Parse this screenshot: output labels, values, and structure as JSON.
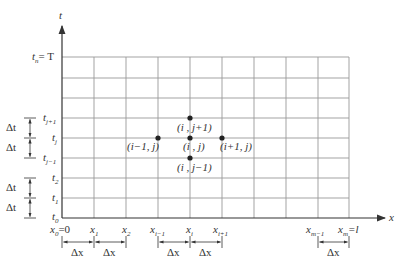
{
  "diagram": {
    "axes": {
      "x_label": "x",
      "t_label": "t"
    },
    "t_labels": {
      "tn": "t",
      "tn_sub": "n",
      "tn_eq": "= T",
      "tj1": "t",
      "tj1_sub": "j+1",
      "tj": "t",
      "tj_sub": "j",
      "tjm1": "t",
      "tjm1_sub": "j−1",
      "t2": "t",
      "t2_sub": "2",
      "t1": "t",
      "t1_sub": "1",
      "t0": "t",
      "t0_sub": "0"
    },
    "x_labels": {
      "x0": "x",
      "x0_sub": "0",
      "x0_eq": "=0",
      "x1": "x",
      "x1_sub": "1",
      "x2": "x",
      "x2_sub": "2",
      "xim1": "x",
      "xim1_sub": "i−1",
      "xi": "x",
      "xi_sub": "i",
      "xip1": "x",
      "xip1_sub": "i+1",
      "xmm1": "x",
      "xmm1_sub": "m−1",
      "xm": "x",
      "xm_sub": "m",
      "xm_eq": "=l"
    },
    "spacing": {
      "dt": "Δt",
      "dx": "Δx"
    },
    "stencil": {
      "center": "(i , j)",
      "left": "(i−1, j)",
      "right": "(i+1, j)",
      "top": "(i , j+1)",
      "bottom": "(i , j−1)"
    }
  }
}
